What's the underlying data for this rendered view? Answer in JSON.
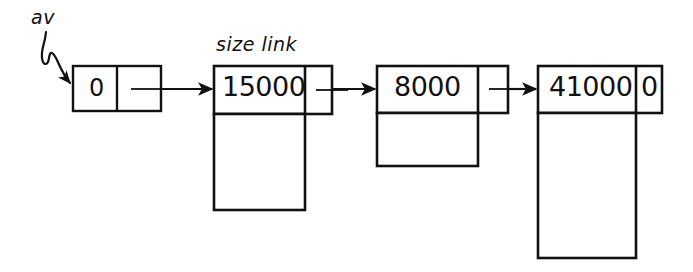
{
  "diagram": {
    "title_labels": {
      "av": "av",
      "size_link": "size link"
    },
    "nodes": [
      {
        "id": "av-node",
        "size_value": "0",
        "link_value": "",
        "has_body": false,
        "x": 73,
        "y": 66,
        "w": 88,
        "h": 45,
        "divider_x": 117,
        "body_h": 0
      },
      {
        "id": "block-15000",
        "size_value": "15000",
        "link_value": "",
        "has_body": true,
        "x": 214,
        "y": 66,
        "w": 118,
        "h": 48,
        "divider_x": 305,
        "body_h": 96
      },
      {
        "id": "block-8000",
        "size_value": "8000",
        "link_value": "",
        "has_body": true,
        "x": 377,
        "y": 66,
        "w": 131,
        "h": 47,
        "divider_x": 478,
        "body_h": 53
      },
      {
        "id": "block-41000",
        "size_value": "41000",
        "link_value": "0",
        "has_body": true,
        "x": 538,
        "y": 66,
        "w": 124,
        "h": 47,
        "divider_x": 636,
        "body_h": 145
      }
    ],
    "arrows": [
      {
        "id": "av-pointer-arrow",
        "from": "av-label",
        "to": "av-node"
      },
      {
        "id": "link-arrow-1",
        "from": "av-node",
        "to": "block-15000"
      },
      {
        "id": "link-arrow-2",
        "from": "block-15000",
        "to": "block-8000"
      },
      {
        "id": "link-arrow-3",
        "from": "block-8000",
        "to": "block-41000"
      }
    ],
    "colors": {
      "ink": "#111111",
      "background": "#ffffff"
    }
  }
}
